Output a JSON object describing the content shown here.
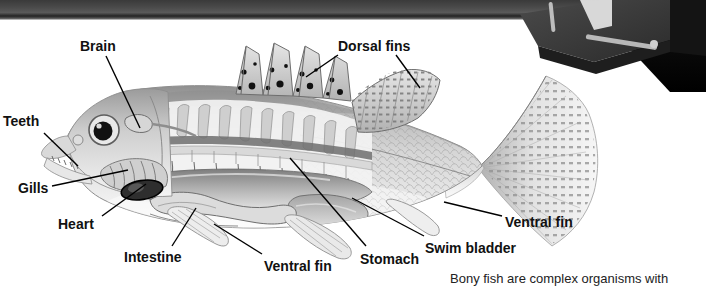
{
  "figure": {
    "caption": "Bony fish are complex organisms with",
    "background_color": "#ffffff",
    "label_color": "#111111",
    "leader_color": "#000000"
  },
  "scan_artifacts": {
    "top_band": {
      "name": "scanner-edge-band",
      "color": "#3a3a3a"
    },
    "corner_object": {
      "name": "dark-3d-object",
      "color": "#2d2d2d",
      "accent_color": "#b9b9b9"
    }
  },
  "labels": [
    {
      "id": "brain",
      "text": "Brain",
      "x": 80,
      "y": 38
    },
    {
      "id": "dorsal-fins",
      "text": "Dorsal fins",
      "x": 338,
      "y": 38
    },
    {
      "id": "teeth",
      "text": "Teeth",
      "x": 3,
      "y": 113
    },
    {
      "id": "gills",
      "text": "Gills",
      "x": 18,
      "y": 180
    },
    {
      "id": "heart",
      "text": "Heart",
      "x": 58,
      "y": 216
    },
    {
      "id": "intestine",
      "text": "Intestine",
      "x": 124,
      "y": 249
    },
    {
      "id": "ventral-fin-left",
      "text": "Ventral fin",
      "x": 264,
      "y": 258
    },
    {
      "id": "stomach",
      "text": "Stomach",
      "x": 360,
      "y": 251
    },
    {
      "id": "swim-bladder",
      "text": "Swim bladder",
      "x": 425,
      "y": 240
    },
    {
      "id": "ventral-fin-right",
      "text": "Ventral fin",
      "x": 505,
      "y": 214
    }
  ],
  "fish": {
    "name": "bony-fish-illustration",
    "style": "grayscale halftone anatomical cutaway",
    "parts": [
      "spiny dorsal fin with dark spots",
      "soft dorsal fin",
      "forked caudal tail fin",
      "scaled body",
      "head with large eye",
      "open mouth with teeth",
      "gill arches",
      "heart",
      "stomach",
      "intestine",
      "swim bladder",
      "ventral fins",
      "vertebral column and ribs"
    ]
  }
}
